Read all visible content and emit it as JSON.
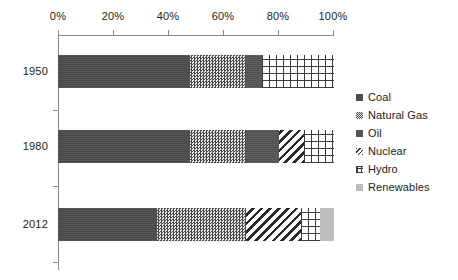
{
  "chart_data": {
    "type": "bar",
    "orientation": "horizontal",
    "stacked": true,
    "normalized_percent": true,
    "title": "",
    "subtitle": "",
    "xlabel": "",
    "ylabel": "",
    "xlim": [
      0,
      100
    ],
    "grid": false,
    "legend_position": "right",
    "categories": [
      "1950",
      "1980",
      "2012"
    ],
    "x_tick_labels": [
      "0%",
      "20%",
      "40%",
      "60%",
      "80%",
      "100%"
    ],
    "x_tick_values": [
      0,
      20,
      40,
      60,
      80,
      100
    ],
    "series": [
      {
        "name": "Coal",
        "pattern": "solid-dark",
        "color": "#4d4d4d",
        "values": [
          48,
          48,
          36
        ]
      },
      {
        "name": "Natural Gas",
        "pattern": "dotted",
        "color": "#d9d9d9",
        "values": [
          20,
          20,
          32
        ]
      },
      {
        "name": "Oil",
        "pattern": "solid-dark",
        "color": "#555555",
        "values": [
          6,
          12,
          0
        ]
      },
      {
        "name": "Nuclear",
        "pattern": "diagonal",
        "color": "#2b2b2b",
        "values": [
          0,
          9,
          20
        ]
      },
      {
        "name": "Hydro",
        "pattern": "crosshatch",
        "color": "#3a3a3a",
        "values": [
          26,
          11,
          7
        ]
      },
      {
        "name": "Renewables",
        "pattern": "solid-light",
        "color": "#bdbdbd",
        "values": [
          0,
          0,
          5
        ]
      }
    ],
    "bars": [
      {
        "category": "1950",
        "segments": [
          {
            "name": "Coal",
            "start": 0,
            "end": 48,
            "value": 48
          },
          {
            "name": "Natural Gas",
            "start": 48,
            "end": 68,
            "value": 20
          },
          {
            "name": "Oil",
            "start": 68,
            "end": 74,
            "value": 6
          },
          {
            "name": "Hydro",
            "start": 74,
            "end": 100,
            "value": 26
          }
        ]
      },
      {
        "category": "1980",
        "segments": [
          {
            "name": "Coal",
            "start": 0,
            "end": 48,
            "value": 48
          },
          {
            "name": "Natural Gas",
            "start": 48,
            "end": 68,
            "value": 20
          },
          {
            "name": "Oil",
            "start": 68,
            "end": 80,
            "value": 12
          },
          {
            "name": "Nuclear",
            "start": 80,
            "end": 89,
            "value": 9
          },
          {
            "name": "Hydro",
            "start": 89,
            "end": 100,
            "value": 11
          }
        ]
      },
      {
        "category": "2012",
        "segments": [
          {
            "name": "Coal",
            "start": 0,
            "end": 36,
            "value": 36
          },
          {
            "name": "Natural Gas",
            "start": 36,
            "end": 68,
            "value": 32
          },
          {
            "name": "Nuclear",
            "start": 68,
            "end": 88,
            "value": 20
          },
          {
            "name": "Hydro",
            "start": 88,
            "end": 95,
            "value": 7
          },
          {
            "name": "Renewables",
            "start": 95,
            "end": 100,
            "value": 5
          }
        ]
      }
    ]
  },
  "axis": {
    "x_labels": [
      "0%",
      "20%",
      "40%",
      "60%",
      "80%",
      "100%"
    ],
    "y_labels": [
      "1950",
      "1980",
      "2012"
    ]
  },
  "legend": {
    "items": [
      {
        "label": "Coal"
      },
      {
        "label": "Natural Gas"
      },
      {
        "label": "Oil"
      },
      {
        "label": "Nuclear"
      },
      {
        "label": "Hydro"
      },
      {
        "label": "Renewables"
      }
    ]
  }
}
